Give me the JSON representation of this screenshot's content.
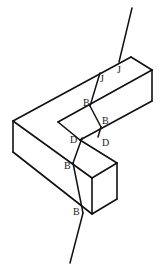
{
  "diagram": {
    "type": "isometric L-shaped block with fracture line",
    "colors": {
      "line": "#111111",
      "label": "#222222",
      "background": "#ffffff"
    },
    "labels": [
      {
        "id": "J1",
        "text": "J",
        "x": 117,
        "y": 73
      },
      {
        "id": "J2",
        "text": "J",
        "x": 100,
        "y": 82
      },
      {
        "id": "B1",
        "text": "B",
        "x": 83,
        "y": 106
      },
      {
        "id": "B2",
        "text": "B",
        "x": 102,
        "y": 124
      },
      {
        "id": "D1",
        "text": "D",
        "x": 70,
        "y": 143
      },
      {
        "id": "D2",
        "text": "D",
        "x": 102,
        "y": 146
      },
      {
        "id": "B3",
        "text": "B",
        "x": 64,
        "y": 169
      },
      {
        "id": "B4",
        "text": "B",
        "x": 73,
        "y": 215
      }
    ]
  }
}
